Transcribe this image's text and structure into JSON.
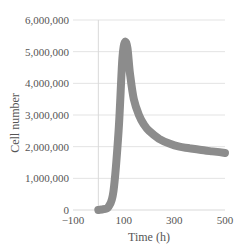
{
  "chart_data": {
    "type": "line",
    "title": "",
    "xlabel": "Time (h)",
    "ylabel": "Cell number",
    "xlim": [
      -100,
      500
    ],
    "ylim": [
      0,
      6000000
    ],
    "x_ticks": [
      -100,
      100,
      300,
      500
    ],
    "x_tick_labels": [
      "−100",
      "100",
      "300",
      "500"
    ],
    "y_ticks": [
      0,
      1000000,
      2000000,
      3000000,
      4000000,
      5000000,
      6000000
    ],
    "y_tick_labels": [
      "0",
      "1,000,000",
      "2,000,000",
      "3,000,000",
      "4,000,000",
      "5,000,000",
      "6,000,000"
    ],
    "grid": "horizontal",
    "legend": "none",
    "series": [
      {
        "name": "Cell number",
        "color": "#8c8c8c",
        "x": [
          0,
          20,
          40,
          60,
          80,
          95,
          105,
          115,
          125,
          140,
          160,
          180,
          200,
          240,
          280,
          320,
          360,
          400,
          450,
          500
        ],
        "values": [
          0,
          30000,
          100000,
          600000,
          2500000,
          4800000,
          5300000,
          5100000,
          4300000,
          3500000,
          3000000,
          2700000,
          2500000,
          2250000,
          2100000,
          2000000,
          1950000,
          1900000,
          1850000,
          1800000
        ]
      }
    ]
  }
}
